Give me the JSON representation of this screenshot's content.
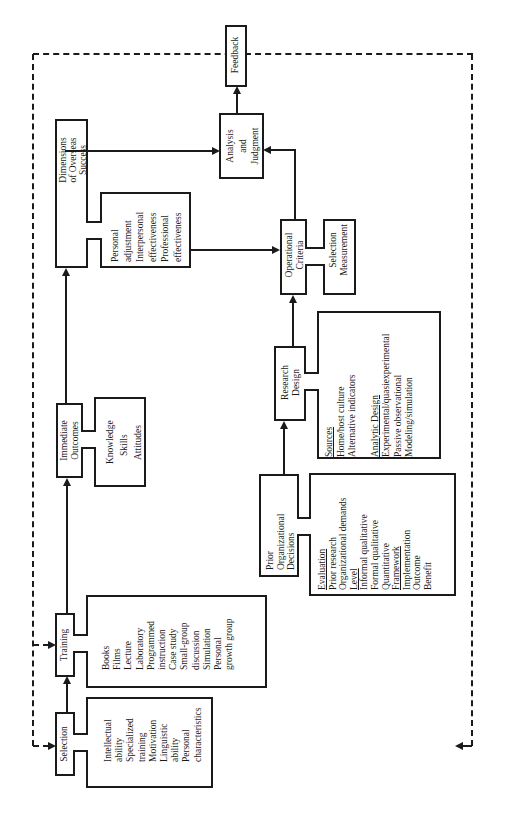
{
  "diagram": {
    "orientation": "rotated-90-ccw",
    "nodes": {
      "selection": {
        "label": "Selection",
        "details": [
          "Intellectual",
          "ability",
          "Specialized",
          "training",
          "Motivation",
          "Linguistic",
          "ability",
          "Personal",
          "characteristics"
        ]
      },
      "training": {
        "label": "Training",
        "details": [
          "Books",
          "Films",
          "Lecture",
          "Laboratory",
          "Programmed",
          "instruction",
          "Case study",
          "Small-group",
          "discussion",
          "Simulation",
          "Personal",
          "growth group"
        ]
      },
      "immediate_outcomes": {
        "label_lines": [
          "Immediate",
          "Outcomes"
        ],
        "details": [
          "Knowledge",
          "Skills",
          "Attitudes"
        ]
      },
      "dimensions": {
        "label_lines": [
          "Dimensions",
          "of Overseas",
          "Success"
        ],
        "details": [
          "Personal",
          "adjustment",
          "Interpersonal",
          "effectiveness",
          "Professional",
          "effectiveness"
        ]
      },
      "analysis": {
        "label_lines": [
          "Analysis",
          "and",
          "Judgment"
        ]
      },
      "feedback": {
        "label": "Feedback"
      },
      "operational_criteria": {
        "label_lines": [
          "Operational",
          "Criteria"
        ],
        "details": [
          "Selection",
          "Measurement"
        ]
      },
      "research_design": {
        "label_lines": [
          "Research",
          "Design"
        ],
        "details": [
          {
            "text": "Sources",
            "underline": true
          },
          {
            "text": "Home/host culture",
            "underline": false
          },
          {
            "text": "Alternative indicators",
            "underline": false
          },
          {
            "text": "",
            "underline": false
          },
          {
            "text": "Analytic Design",
            "underline": true
          },
          {
            "text": "Experimental/quasiexperimental",
            "underline": false
          },
          {
            "text": "Passive observational",
            "underline": false
          },
          {
            "text": "Modeling/simulation",
            "underline": false
          }
        ]
      },
      "prior_decisions": {
        "label_lines": [
          "Prior",
          "Organizational",
          "Decisions"
        ],
        "details": [
          {
            "text": "Evaluation",
            "underline": true
          },
          {
            "text": "Prior research",
            "underline": false
          },
          {
            "text": "Organizational demands",
            "underline": false
          },
          {
            "text": "Level",
            "underline": true
          },
          {
            "text": "Informal qualitative",
            "underline": false
          },
          {
            "text": "Formal qualitative",
            "underline": false
          },
          {
            "text": "Quantitative",
            "underline": false
          },
          {
            "text": "Framework",
            "underline": true
          },
          {
            "text": "Implementation",
            "underline": false
          },
          {
            "text": "Outcome",
            "underline": false
          },
          {
            "text": "Benefit",
            "underline": false
          }
        ]
      }
    },
    "edges": [
      {
        "from": "Selection",
        "to": "Training",
        "style": "solid"
      },
      {
        "from": "Training",
        "to": "Immediate Outcomes",
        "style": "solid"
      },
      {
        "from": "Immediate Outcomes",
        "to": "Dimensions of Overseas Success",
        "style": "solid"
      },
      {
        "from": "Dimensions of Overseas Success",
        "to": "Analysis and Judgment",
        "style": "solid"
      },
      {
        "from": "Dimensions of Overseas Success",
        "to": "Operational Criteria",
        "style": "solid"
      },
      {
        "from": "Prior Organizational Decisions",
        "to": "Research Design",
        "style": "solid"
      },
      {
        "from": "Research Design",
        "to": "Operational Criteria",
        "style": "solid"
      },
      {
        "from": "Operational Criteria",
        "to": "Analysis and Judgment",
        "style": "solid"
      },
      {
        "from": "Analysis and Judgment",
        "to": "Feedback",
        "style": "solid"
      },
      {
        "from": "Feedback",
        "to": "Selection",
        "style": "dashed"
      },
      {
        "from": "Feedback",
        "to": "Training",
        "style": "dashed"
      },
      {
        "from": "Feedback",
        "to": "Prior Organizational Decisions",
        "style": "dashed"
      }
    ]
  }
}
